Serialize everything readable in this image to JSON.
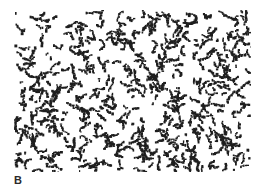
{
  "figure": {
    "panel_label": "B",
    "pattern": {
      "description": "binary micrograph-like field of dark irregular speckle clusters on white background",
      "x": 14,
      "y": 10,
      "width": 237,
      "height": 162,
      "foreground_color": "#1e1e1e",
      "background_color": "#ffffff",
      "cluster_count": 520,
      "seed": 7
    }
  }
}
